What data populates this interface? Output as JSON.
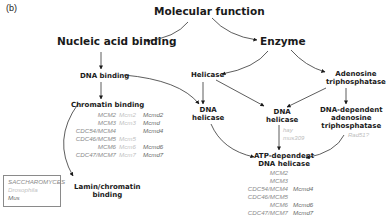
{
  "panel_label": "(b)",
  "nodes": {
    "molecular_function": "Molecular function",
    "nucleic_acid_binding": "Nucleic acid binding",
    "enzyme": "Enzyme",
    "dna_binding": "DNA binding",
    "helicase": "Helicase",
    "adenosine_triphosphatase": [
      "Adenosine",
      "triphosphatase"
    ],
    "chromatin_binding": "Chromatin binding",
    "dna_helicase_left": [
      "DNA",
      "helicase"
    ],
    "dna_helicase_mid": [
      "DNA",
      "helicase"
    ],
    "dna_dependent_atpase": [
      "DNA-dependent",
      "adenosine",
      "triphosphatase"
    ],
    "atp_dependent_dna_helicase": [
      "ATP-dependent",
      "DNA helicase"
    ],
    "lamin_chromatin_binding": [
      "Lamin/chromatin",
      "binding"
    ]
  },
  "gene_lists": {
    "chromatin_binding": [
      [
        "MCM2",
        "Mcm2",
        "Mcmd2"
      ],
      [
        "MCM3",
        "Mcm3",
        "Mcmd"
      ],
      [
        "CDC54/MCM4",
        "",
        "Mcmd4"
      ],
      [
        "CDC46/MCM5",
        "Mcm5",
        ""
      ],
      [
        "MCM6",
        "Mcm6",
        "Mcmd6"
      ],
      [
        "CDC47/MCM7",
        "Mcm7",
        "Mcmd7"
      ]
    ],
    "atp_dependent_dna_helicase": [
      [
        "MCM2",
        "",
        ""
      ],
      [
        "MCM3",
        "",
        ""
      ],
      [
        "CDC54/MCM4",
        "",
        "Mcmd4"
      ],
      [
        "CDC46/MCM5",
        "",
        ""
      ],
      [
        "MCM6",
        "",
        "Mcmd6"
      ],
      [
        "CDC47/MCM7",
        "",
        "Mcmd7"
      ]
    ],
    "dna_helicase_mid": [
      "hay",
      "mus309"
    ],
    "dna_dependent_atpase": [
      "Rad51?"
    ]
  },
  "legend": {
    "items": [
      "SACCHAROMYCES",
      "Drosophila",
      "Mus"
    ],
    "colors": [
      "#8a8a8a",
      "#c2c2c2",
      "#6a6a6a"
    ]
  }
}
